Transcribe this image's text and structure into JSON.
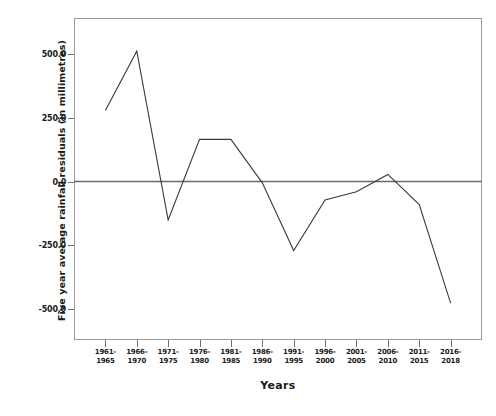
{
  "chart_data": {
    "type": "line",
    "title": "",
    "xlabel": "Years",
    "ylabel": "Five year average rainfall residuals (in millimetres)",
    "categories": [
      "1961-\n1965",
      "1966-\n1970",
      "1971-\n1975",
      "1976-\n1980",
      "1981-\n1985",
      "1986-\n1990",
      "1991-\n1995",
      "1996-\n2000",
      "2001-\n2005",
      "2006-\n2010",
      "2011-\n2015",
      "2016-\n2018"
    ],
    "values": [
      278,
      510,
      -150,
      165,
      165,
      -5,
      -270,
      -72,
      -40,
      28,
      -90,
      -476
    ],
    "ylim": [
      -620,
      640
    ],
    "yticks": [
      500.0,
      250.0,
      0.0,
      -250.0,
      -500.0
    ],
    "ytick_labels": [
      "500.0",
      "250.0",
      "0.0",
      "-250.0",
      "-500.0"
    ],
    "grid": false,
    "legend": false,
    "zero_reference_line": true,
    "line_color": "#3a3a3a",
    "frame_color": "#9a9a9a"
  },
  "axis": {
    "x_title": "Years",
    "y_title": "Five year average rainfall residuals (in millimetres)",
    "x_tick_rows": [
      [
        "1961-",
        "1965"
      ],
      [
        "1966-",
        "1970"
      ],
      [
        "1971-",
        "1975"
      ],
      [
        "1976-",
        "1980"
      ],
      [
        "1981-",
        "1985"
      ],
      [
        "1986-",
        "1990"
      ],
      [
        "1991-",
        "1995"
      ],
      [
        "1996-",
        "2000"
      ],
      [
        "2001-",
        "2005"
      ],
      [
        "2006-",
        "2010"
      ],
      [
        "2011-",
        "2015"
      ],
      [
        "2016-",
        "2018"
      ]
    ]
  },
  "caption": {
    "text": ""
  }
}
